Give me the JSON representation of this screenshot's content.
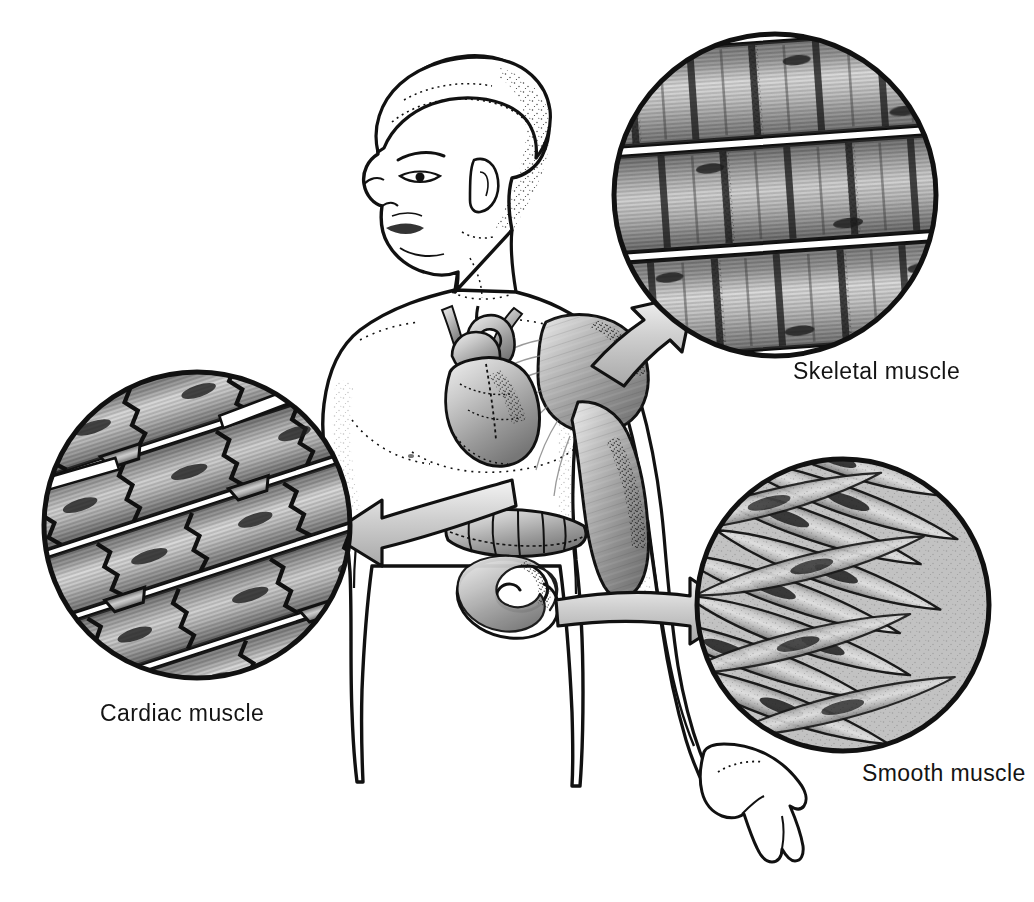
{
  "figure": {
    "background_color": "#ffffff",
    "ink_color": "#111111",
    "style": "grayscale medical line illustration with stippling"
  },
  "subject": {
    "name": "human-figure",
    "description": "Young adult male torso in left three-quarter profile, head turned to the viewer's left, right arm hanging down at the side",
    "visible_parts": [
      "head",
      "hair",
      "face-profile",
      "ear",
      "neck",
      "shoulders",
      "chest",
      "abdomen",
      "right-arm",
      "right-hand",
      "hips"
    ]
  },
  "organs": [
    {
      "id": "heart",
      "label": "heart",
      "description": "Heart with great vessels shown inside the chest, shaded gray",
      "links_to": "cardiac"
    },
    {
      "id": "deltoid",
      "label": "shoulder and arm muscle",
      "description": "Deltoid and biceps muscle bellies with fibrous striations on the shoulder and upper arm",
      "links_to": "skeletal"
    },
    {
      "id": "intestine",
      "label": "intestine",
      "description": "Segment of transverse colon and small intestine in the abdomen",
      "links_to": "smooth"
    }
  ],
  "insets": [
    {
      "id": "skeletal",
      "label": "Skeletal muscle",
      "tissue_type": "skeletal",
      "shape": "circle",
      "cx": 775,
      "cy": 195,
      "r": 163,
      "appearance": "Long unbranched cylindrical fibers lying in parallel horizontal bands with dark cross-striations; multiple peripheral nuclei",
      "fiber_orientation_deg": -4,
      "fill_color": "#9b9b9b",
      "stroke_color": "#111111",
      "arrow_from": "deltoid"
    },
    {
      "id": "cardiac",
      "label": "Cardiac muscle",
      "tissue_type": "cardiac",
      "shape": "circle",
      "cx": 197,
      "cy": 525,
      "r": 155,
      "appearance": "Short branching striated fibers joined end to end by dark zigzag intercalated discs; single central nuclei",
      "fiber_orientation_deg": -18,
      "fill_color": "#a0a0a0",
      "stroke_color": "#111111",
      "arrow_from": "heart"
    },
    {
      "id": "smooth",
      "label": "Smooth muscle",
      "tissue_type": "smooth",
      "shape": "circle",
      "cx": 843,
      "cy": 605,
      "r": 148,
      "appearance": "Interwoven sheets of spindle-shaped (fusiform) non-striated cells, each with one dark central nucleus",
      "fiber_orientation_deg": 20,
      "fill_color": "#aaaaaa",
      "stroke_color": "#111111",
      "arrow_from": "intestine"
    }
  ],
  "arrows": [
    {
      "id": "arrow-skeletal",
      "from": "deltoid",
      "to": "skeletal",
      "direction": "up-right",
      "description": "Tapered arrow from the shoulder muscle pointing up and to the right into the skeletal muscle inset"
    },
    {
      "id": "arrow-cardiac",
      "from": "heart",
      "to": "cardiac",
      "direction": "left",
      "description": "Tapered arrow from the heart pointing left into the cardiac muscle inset"
    },
    {
      "id": "arrow-smooth",
      "from": "intestine",
      "to": "smooth",
      "direction": "right",
      "description": "Tapered arrow from the intestine pointing right into the smooth muscle inset"
    }
  ]
}
